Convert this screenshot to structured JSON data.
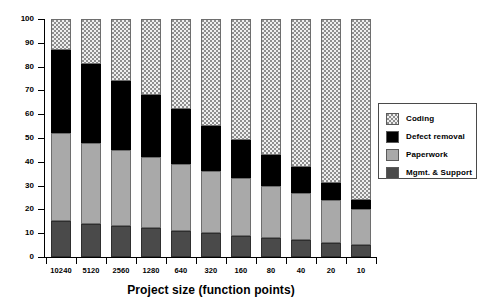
{
  "chart_data": {
    "type": "bar",
    "subtype": "stacked-bar-100-percent",
    "title": "",
    "xlabel": "Project size (function points)",
    "ylabel": "",
    "ylim": [
      0,
      100
    ],
    "yticks": [
      0,
      10,
      20,
      30,
      40,
      50,
      60,
      70,
      80,
      90,
      100
    ],
    "ytick_labels": [
      "0",
      "10",
      "20",
      "30",
      "40",
      "50",
      "60",
      "70",
      "80",
      "90",
      "100"
    ],
    "grid": false,
    "legend_position": "right",
    "categories": [
      "10240",
      "5120",
      "2560",
      "1280",
      "640",
      "320",
      "160",
      "80",
      "40",
      "20",
      "10"
    ],
    "series": [
      {
        "name": "Mgmt. & Support",
        "color": "#4a4a4a",
        "pattern": "solid-dark-gray",
        "values": [
          15,
          14,
          13,
          12,
          11,
          10,
          9,
          8,
          7,
          6,
          5
        ]
      },
      {
        "name": "Paperwork",
        "color": "#a9a9a9",
        "pattern": "solid-light-gray",
        "values": [
          37,
          34,
          32,
          30,
          28,
          26,
          24,
          22,
          20,
          18,
          15
        ]
      },
      {
        "name": "Defect removal",
        "color": "#000000",
        "pattern": "solid-black",
        "values": [
          35,
          33,
          29,
          26,
          23,
          19,
          16,
          13,
          11,
          7,
          4
        ]
      },
      {
        "name": "Coding",
        "color": "#efefef",
        "pattern": "dotted-stipple",
        "values": [
          13,
          19,
          26,
          32,
          38,
          45,
          51,
          57,
          62,
          69,
          76
        ]
      }
    ],
    "cumulative_tops": {
      "10240": [
        15,
        52,
        87,
        100
      ],
      "5120": [
        14,
        48,
        81,
        100
      ],
      "2560": [
        13,
        45,
        74,
        100
      ],
      "1280": [
        12,
        42,
        68,
        100
      ],
      "640": [
        11,
        39,
        62,
        100
      ],
      "320": [
        10,
        36,
        55,
        100
      ],
      "160": [
        9,
        33,
        49,
        100
      ],
      "80": [
        8,
        30,
        43,
        100
      ],
      "40": [
        7,
        27,
        38,
        100
      ],
      "20": [
        6,
        24,
        31,
        100
      ],
      "10": [
        5,
        20,
        24,
        100
      ]
    }
  },
  "legend": {
    "items": [
      {
        "label": "Coding",
        "swatch": "dotted-stipple"
      },
      {
        "label": "Defect removal",
        "swatch": "solid-black"
      },
      {
        "label": "Paperwork",
        "swatch": "solid-light-gray"
      },
      {
        "label": "Mgmt. & Support",
        "swatch": "solid-dark-gray"
      }
    ]
  }
}
